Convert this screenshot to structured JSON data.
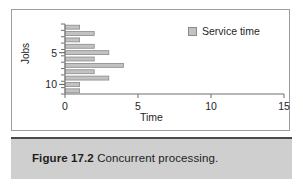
{
  "figure": {
    "caption_label": "Figure 17.2",
    "caption_body": "Concurrent processing."
  },
  "legend": {
    "position": "top-right",
    "entries": [
      {
        "label": "Service time",
        "color": "#c2c2c2"
      }
    ]
  },
  "colors": {
    "bar_fill": "#c2c2c2",
    "bar_stroke": "#8a8a8a",
    "axis": "#6e6e6e",
    "caption_band": "#cfcfcf",
    "frame": "#9d9d9d",
    "text": "#262626"
  },
  "chart_data": {
    "type": "bar",
    "orientation": "horizontal",
    "title": "",
    "subtitle": "",
    "xlabel": "Time",
    "ylabel": "Jobs",
    "categories": [
      1,
      2,
      3,
      4,
      5,
      6,
      7,
      8,
      9,
      10,
      11
    ],
    "series": [
      {
        "name": "Service time",
        "values": [
          1,
          2,
          1,
          2,
          3,
          2,
          4,
          2,
          3,
          1,
          1
        ]
      }
    ],
    "values": [
      1,
      2,
      1,
      2,
      3,
      2,
      4,
      2,
      3,
      1,
      1
    ],
    "xlim": [
      0,
      15
    ],
    "ylim": [
      0.5,
      11.5
    ],
    "xticks": [
      0,
      5,
      10,
      15
    ],
    "xtick_labels": [
      "0",
      "5",
      "10",
      "15"
    ],
    "yticks": [
      5,
      10
    ],
    "ytick_labels": [
      "5",
      "10"
    ],
    "grid": false,
    "legend_position": "top-right"
  }
}
